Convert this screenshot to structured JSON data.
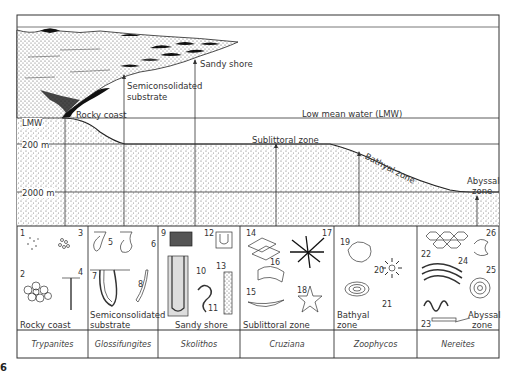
{
  "figure": {
    "number": "6",
    "title_area": "Marine ichnofacies along an onshore–offshore profile"
  },
  "profile": {
    "level_markers": [
      "LMW",
      "200 m",
      "2000 m"
    ],
    "environments": [
      {
        "label": "Rocky coast"
      },
      {
        "label": "Semiconsolidated substrate"
      },
      {
        "label": "Sandy shore"
      },
      {
        "label": "Low mean water (LMW)"
      },
      {
        "label": "Sublittoral zone"
      },
      {
        "label": "Bathyal zone"
      },
      {
        "label": "Abyssal zone"
      }
    ]
  },
  "panels": [
    {
      "zone": "Rocky coast",
      "ichnofacies": "Trypanites",
      "traces": [
        "1",
        "2",
        "3",
        "4"
      ]
    },
    {
      "zone": "Semiconsolidated substrate",
      "ichnofacies": "Glossifungites",
      "traces": [
        "5",
        "6",
        "7",
        "8"
      ]
    },
    {
      "zone": "Sandy shore",
      "ichnofacies": "Skolithos",
      "traces": [
        "9",
        "10",
        "11",
        "12",
        "13"
      ]
    },
    {
      "zone": "Sublittoral zone",
      "ichnofacies": "Cruziana",
      "traces": [
        "14",
        "15",
        "16",
        "17",
        "18"
      ]
    },
    {
      "zone": "Bathyal zone",
      "ichnofacies": "Zoophycos",
      "traces": [
        "19",
        "20",
        "21"
      ]
    },
    {
      "zone": "Abyssal zone",
      "ichnofacies": "Nereites",
      "traces": [
        "22",
        "23",
        "24",
        "25",
        "26"
      ]
    }
  ],
  "labels": {
    "lmw": "LMW",
    "m200": "200 m",
    "m2000": "2000 m",
    "rocky": "Rocky coast",
    "semi1": "Semiconsolidated",
    "semi2": "substrate",
    "sandy": "Sandy shore",
    "lowmean": "Low mean water (LMW)",
    "sublit": "Sublittoral zone",
    "bathyal": "Bathyal zone",
    "abyssal1": "Abyssal",
    "abyssal2": "zone",
    "p1zone": "Rocky coast",
    "p2zone1": "Semiconsolidated",
    "p2zone2": "substrate",
    "p3zone": "Sandy shore",
    "p4zone": "Sublittoral zone",
    "p5zone1": "Bathyal",
    "p5zone2": "zone",
    "p6zone1": "Abyssal",
    "p6zone2": "zone"
  },
  "colors": {
    "line": "#333333",
    "stipple": "#777777",
    "rock": "#111111"
  }
}
